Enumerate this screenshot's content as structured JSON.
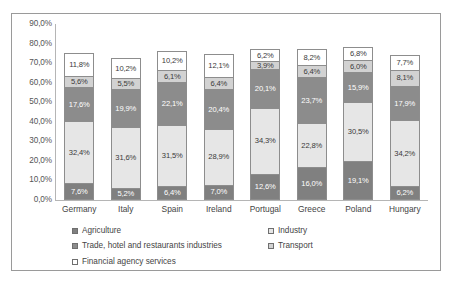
{
  "chart_data": {
    "type": "bar",
    "subtype": "100% stacked column",
    "title": "",
    "xlabel": "",
    "ylabel": "",
    "ylim": [
      0,
      90
    ],
    "grid": false,
    "legend_position": "bottom",
    "decimal_separator": ",",
    "value_suffix": "%",
    "categories": [
      "Germany",
      "Italy",
      "Spain",
      "Ireland",
      "Portugal",
      "Greece",
      "Poland",
      "Hungary"
    ],
    "y_ticks": [
      "0,0%",
      "10,0%",
      "20,0%",
      "30,0%",
      "40,0%",
      "50,0%",
      "60,0%",
      "70,0%",
      "80,0%",
      "90,0%"
    ],
    "y_tick_values": [
      0,
      10,
      20,
      30,
      40,
      50,
      60,
      70,
      80,
      90
    ],
    "series": [
      {
        "name": "Agriculture",
        "color": "#808080",
        "values": [
          7.6,
          5.2,
          6.4,
          7.0,
          12.6,
          16.0,
          19.1,
          6.2
        ],
        "labels": [
          "7,6%",
          "5,2%",
          "6,4%",
          "7,0%",
          "12,6%",
          "16,0%",
          "19,1%",
          "6,2%"
        ]
      },
      {
        "name": "Industry",
        "color": "#e6e6e6",
        "values": [
          32.4,
          31.6,
          31.5,
          28.9,
          34.3,
          22.8,
          30.5,
          34.2
        ],
        "labels": [
          "32,4%",
          "31,6%",
          "31,5%",
          "28,9%",
          "34,3%",
          "22,8%",
          "30,5%",
          "34,2%"
        ]
      },
      {
        "name": "Trade, hotel and restaurants industries",
        "color": "#8c8c8c",
        "values": [
          17.6,
          19.9,
          22.1,
          20.4,
          20.1,
          23.7,
          15.9,
          17.9
        ],
        "labels": [
          "17,6%",
          "19,9%",
          "22,1%",
          "20,4%",
          "20,1%",
          "23,7%",
          "15,9%",
          "17,9%"
        ]
      },
      {
        "name": "Transport",
        "color": "#d2d2d2",
        "values": [
          5.6,
          5.5,
          6.1,
          6.4,
          3.9,
          6.4,
          6.0,
          8.1
        ],
        "labels": [
          "5,6%",
          "5,5%",
          "6,1%",
          "6,4%",
          "3,9%",
          "6,4%",
          "6,0%",
          "8,1%"
        ]
      },
      {
        "name": "Financial agency services",
        "color": "#ffffff",
        "values": [
          11.8,
          10.2,
          10.2,
          12.1,
          6.2,
          8.2,
          6.8,
          7.7
        ],
        "labels": [
          "11,8%",
          "10,2%",
          "10,2%",
          "12,1%",
          "6,2%",
          "8,2%",
          "6,8%",
          "7,7%"
        ]
      }
    ]
  },
  "legend": {
    "items": [
      {
        "label": "Agriculture",
        "swatch_class": "sw-agriculture",
        "name": "agriculture"
      },
      {
        "label": "Industry",
        "swatch_class": "sw-industry",
        "name": "industry"
      },
      {
        "label": "Trade, hotel and restaurants industries",
        "swatch_class": "sw-trade",
        "name": "trade"
      },
      {
        "label": "Transport",
        "swatch_class": "sw-transport",
        "name": "transport"
      },
      {
        "label": "Financial agency services",
        "swatch_class": "sw-financial",
        "name": "financial"
      }
    ]
  }
}
